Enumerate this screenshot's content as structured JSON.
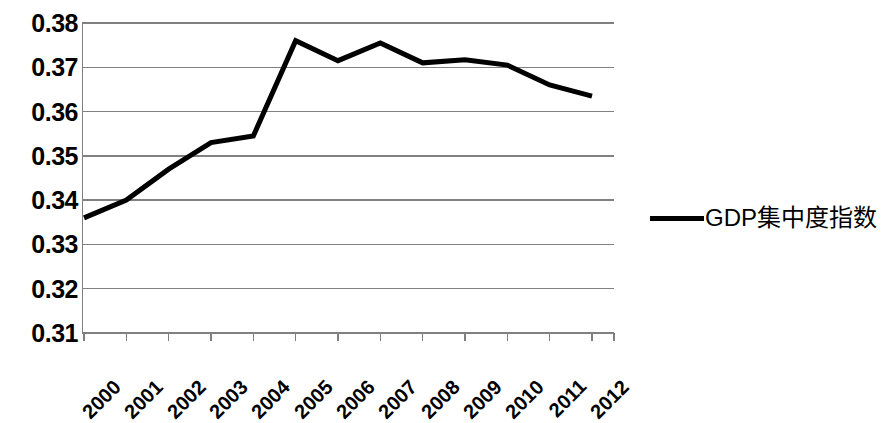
{
  "chart_data": {
    "type": "line",
    "title": "",
    "xlabel": "",
    "ylabel": "",
    "grid": true,
    "legend_position": "right",
    "categories": [
      "2000",
      "2001",
      "2002",
      "2003",
      "2004",
      "2005",
      "2006",
      "2007",
      "2008",
      "2009",
      "2010",
      "2011",
      "2012"
    ],
    "ylim": [
      0.31,
      0.38
    ],
    "ytick_labels": [
      "0.38",
      "0.37",
      "0.36",
      "0.35",
      "0.34",
      "0.33",
      "0.32",
      "0.31"
    ],
    "ytick_values": [
      0.38,
      0.37,
      0.36,
      0.35,
      0.34,
      0.33,
      0.32,
      0.31
    ],
    "series": [
      {
        "name": "GDP集中度指数",
        "color": "#000000",
        "values": [
          0.336,
          0.34,
          0.347,
          0.353,
          0.3545,
          0.376,
          0.3715,
          0.3755,
          0.371,
          0.3717,
          0.3705,
          0.366,
          0.3635
        ]
      }
    ]
  },
  "legend": {
    "entries": [
      {
        "label": "GDP集中度指数",
        "color": "#000000"
      }
    ]
  },
  "axes": {
    "y_axis_name": "y-axis",
    "x_axis_name": "x-axis"
  }
}
